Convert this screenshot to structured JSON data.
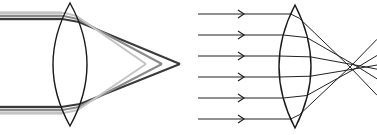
{
  "figures": [
    {
      "id": "chromatic-aberration",
      "description": "Converging lens with parallel bundles of different wavelengths focusing at different points",
      "lens": {
        "cx": 70,
        "top": 3,
        "bottom": 126,
        "half_width": 17
      },
      "bundles_y": [
        16,
        110
      ],
      "rays": [
        {
          "name": "dark",
          "color": "#3a3a3a",
          "offset": -3,
          "focus_x": 180
        },
        {
          "name": "mid",
          "color": "#8a8a8a",
          "offset": 0,
          "focus_x": 162
        },
        {
          "name": "light",
          "color": "#c4c4c4",
          "offset": 3,
          "focus_x": 146
        }
      ],
      "focus_y": 64
    },
    {
      "id": "spherical-aberration",
      "description": "Parallel rays with arrows through converging lens, outer rays focus closer than paraxial rays",
      "lens": {
        "cx": 295,
        "top": 5,
        "bottom": 128,
        "half_width": 16
      },
      "arrow_rows_y": [
        14,
        35,
        56,
        77,
        98,
        119
      ],
      "arrow_x_start": 198,
      "arrowhead_x": 244,
      "focus_points_x": [
        350,
        358,
        366
      ],
      "focus_y": 67,
      "line_color": "#222222"
    }
  ],
  "colors": {
    "background": "#ffffff",
    "line": "#222222"
  }
}
